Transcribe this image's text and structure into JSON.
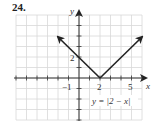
{
  "problem_number": "24.",
  "chart_data": {
    "type": "line",
    "title": "",
    "xlabel": "x",
    "ylabel": "y",
    "xlim": [
      -6,
      6
    ],
    "ylim": [
      -4,
      6
    ],
    "grid": true,
    "tick_labels": {
      "x": [
        "-1",
        "2",
        "5"
      ],
      "y": [
        "2"
      ]
    },
    "series": [
      {
        "name": "y = |2 - x|",
        "x": [
          -2,
          2,
          6
        ],
        "y": [
          4,
          0,
          4
        ],
        "arrows_at_ends": true
      }
    ],
    "annotation": "y = |2 − x|"
  },
  "labels": {
    "x_axis": "x",
    "y_axis": "y",
    "tick_neg1": "−1",
    "tick_2": "2",
    "tick_5": "5",
    "tick_y2": "2",
    "equation": "y = |2 − x|"
  },
  "colors": {
    "grid": "#d8d8d8",
    "axis": "#333333",
    "line": "#222222"
  }
}
